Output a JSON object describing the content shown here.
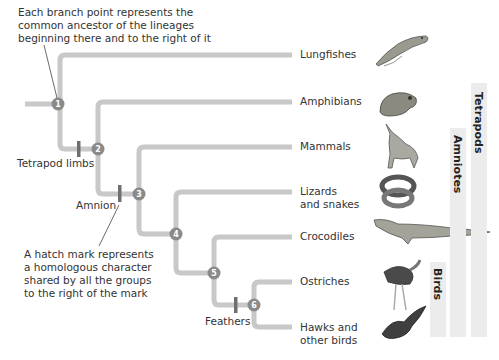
{
  "annotations": {
    "branch_point_note": [
      "Each branch point represents the",
      "common ancestor of the lineages",
      "beginning there and to the right of it"
    ],
    "hatch_mark_note": [
      "A hatch mark represents",
      "a homologous character",
      "shared by all the groups",
      "to the right of the mark"
    ]
  },
  "nodes": [
    "1",
    "2",
    "3",
    "4",
    "5",
    "6"
  ],
  "taxa": [
    {
      "label": "Lungfishes",
      "icon": "lungfish-illustration"
    },
    {
      "label": "Amphibians",
      "icon": "frog-illustration"
    },
    {
      "label": "Mammals",
      "icon": "wolf-illustration"
    },
    {
      "label_lines": [
        "Lizards",
        "and snakes"
      ],
      "icon": "snake-illustration"
    },
    {
      "label": "Crocodiles",
      "icon": "crocodile-illustration"
    },
    {
      "label": "Ostriches",
      "icon": "ostrich-illustration"
    },
    {
      "label_lines": [
        "Hawks and",
        "other birds"
      ],
      "icon": "hawk-illustration"
    }
  ],
  "traits": {
    "tetrapod_limbs": "Tetrapod limbs",
    "amnion": "Amnion",
    "feathers": "Feathers"
  },
  "clades": {
    "tetrapods": "Tetrapods",
    "amniotes": "Amniotes",
    "birds": "Birds"
  },
  "colors": {
    "branch": "#c8c8c8",
    "node": "#8a8a8a",
    "hatch": "#6e6e6e",
    "clade_bar": "#ececec"
  }
}
